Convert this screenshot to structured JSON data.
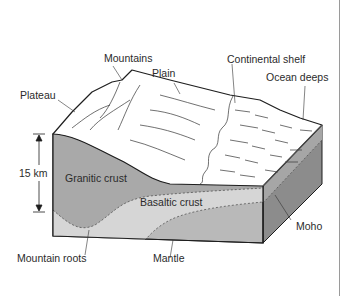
{
  "diagram": {
    "labels": {
      "mountains": "Mountains",
      "plain": "Plain",
      "continental_shelf": "Continental shelf",
      "ocean_deeps": "Ocean deeps",
      "plateau": "Plateau",
      "scale": "15 km",
      "granitic_crust": "Granitic crust",
      "basaltic_crust": "Basaltic crust",
      "moho": "Moho",
      "mountain_roots": "Mountain roots",
      "mantle": "Mantle"
    },
    "colors": {
      "granitic": "#a9a9a9",
      "basaltic": "#d6d6d6",
      "mantle": "#b9b9b9",
      "side_face": "#8c8c8c",
      "side_face_lower": "#7a7a7a",
      "surface": "#ffffff",
      "outline": "#1e1e1e"
    }
  }
}
